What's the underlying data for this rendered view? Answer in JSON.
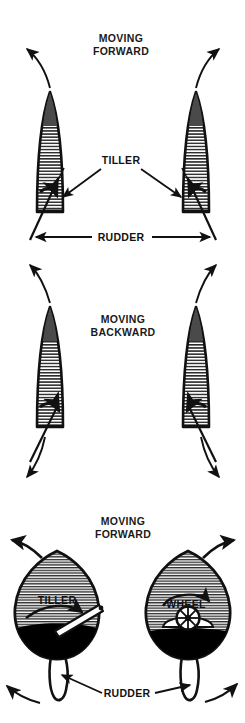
{
  "figure": {
    "title_visible": false,
    "background_color": "#ffffff",
    "ink_color": "#111111",
    "hatch_color": "#2b2b2b",
    "solid_fill_color": "#000000",
    "width": 245,
    "height": 723
  },
  "panels": [
    {
      "id": "panel-top",
      "caption_line1": "MOVING",
      "caption_line2": "FORWARD",
      "caption_x": 121,
      "caption_y": 42,
      "view": "stern-view-two-boats",
      "labels": [
        {
          "name": "tiller-label",
          "text": "TILLER",
          "x": 121,
          "y": 164
        },
        {
          "name": "rudder-label",
          "text": "RUDDER",
          "x": 121,
          "y": 241
        }
      ],
      "boats": [
        {
          "side": "left",
          "tiller_pushed": "right",
          "rudder_swings": "left",
          "bow_turns": "left"
        },
        {
          "side": "right",
          "tiller_pushed": "left",
          "rudder_swings": "right",
          "bow_turns": "right"
        }
      ]
    },
    {
      "id": "panel-middle",
      "caption_line1": "MOVING",
      "caption_line2": "BACKWARD",
      "caption_x": 123,
      "caption_y": 323,
      "view": "stern-view-two-boats",
      "labels": [],
      "boats": [
        {
          "side": "left",
          "tiller_pushed": "right",
          "rudder_swings": "left",
          "stern_turns": "left"
        },
        {
          "side": "right",
          "tiller_pushed": "left",
          "rudder_swings": "right",
          "stern_turns": "right"
        }
      ]
    },
    {
      "id": "panel-bottom",
      "caption_line1": "MOVING",
      "caption_line2": "FORWARD",
      "caption_x": 123,
      "caption_y": 525,
      "view": "plan-view-two-hulls",
      "labels": [
        {
          "name": "tiller-label",
          "text": "TILLER",
          "x": 57,
          "y": 604
        },
        {
          "name": "wheel-label",
          "text": "WHEEL",
          "x": 186,
          "y": 608
        },
        {
          "name": "rudder-label",
          "text": "RUDDER",
          "x": 127,
          "y": 697
        }
      ],
      "hulls": [
        {
          "side": "left",
          "steering_device": "tiller",
          "helm_motion": "clockwise-to-right",
          "rudder_swings": "right",
          "bow_turns": "left"
        },
        {
          "side": "right",
          "steering_device": "wheel",
          "helm_motion": "clockwise-to-right",
          "rudder_swings": "left",
          "bow_turns": "right"
        }
      ]
    }
  ],
  "legend_terms": [
    "TILLER",
    "RUDDER",
    "WHEEL",
    "MOVING FORWARD",
    "MOVING BACKWARD"
  ]
}
